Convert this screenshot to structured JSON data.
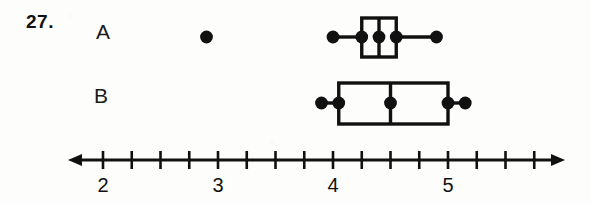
{
  "problem": {
    "number_label": "27."
  },
  "series_labels": {
    "a": "A",
    "b": "B"
  },
  "chart_data": {
    "type": "box",
    "title": "",
    "xlabel": "",
    "ylabel": "",
    "orientation": "horizontal",
    "xlim": [
      1.7,
      6.0
    ],
    "grid": false,
    "legend": "none",
    "axis": {
      "major_tick_labels": [
        "2",
        "3",
        "4",
        "5"
      ],
      "major_tick_values": [
        2,
        3,
        4,
        5
      ],
      "minor_tick_step": 0.25,
      "minor_tick_values": [
        2,
        2.25,
        2.5,
        2.75,
        3,
        3.25,
        3.5,
        3.75,
        4,
        4.25,
        4.5,
        4.75,
        5,
        5.25,
        5.5,
        5.75
      ],
      "arrows": "both"
    },
    "series": [
      {
        "name": "A",
        "min": 4.0,
        "q1": 4.25,
        "median": 4.4,
        "q3": 4.55,
        "max": 4.9,
        "outliers": [
          2.9
        ],
        "marker_points": [
          4.0,
          4.25,
          4.4,
          4.55,
          4.9
        ]
      },
      {
        "name": "B",
        "min": 3.9,
        "q1": 4.05,
        "median": 4.5,
        "q3": 5.0,
        "max": 5.15,
        "outliers": [],
        "marker_points": [
          3.9,
          4.05,
          4.5,
          5.0,
          5.15
        ]
      }
    ],
    "colors": {
      "ink": "#111111",
      "background": "#fdfdfc"
    }
  }
}
